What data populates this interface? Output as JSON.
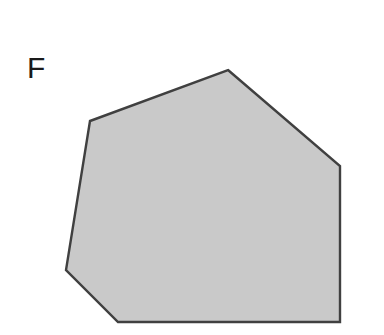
{
  "figure": {
    "label": "F",
    "background_color": "#ffffff",
    "label_color": "#1a1a1a",
    "canvas": {
      "width": 384,
      "height": 335
    }
  },
  "chart_data": {
    "type": "scatter",
    "title": "",
    "subtitle": "",
    "xlabel": "",
    "ylabel": "",
    "grid": false,
    "legend": "none",
    "xlim": [
      0,
      384
    ],
    "ylim": [
      335,
      0
    ],
    "annotations": [
      {
        "text": "F",
        "x": 27,
        "y": 53,
        "fontsize": 30
      }
    ],
    "shapes": [
      {
        "name": "hexagon-F",
        "type": "polygon",
        "sides": 6,
        "fill": "#c9c9c9",
        "stroke": "#404040",
        "stroke_width": 2.4,
        "points": [
          [
            228,
            70
          ],
          [
            340,
            166
          ],
          [
            340,
            322
          ],
          [
            118,
            322
          ],
          [
            66,
            270
          ],
          [
            90,
            121
          ]
        ]
      }
    ]
  }
}
